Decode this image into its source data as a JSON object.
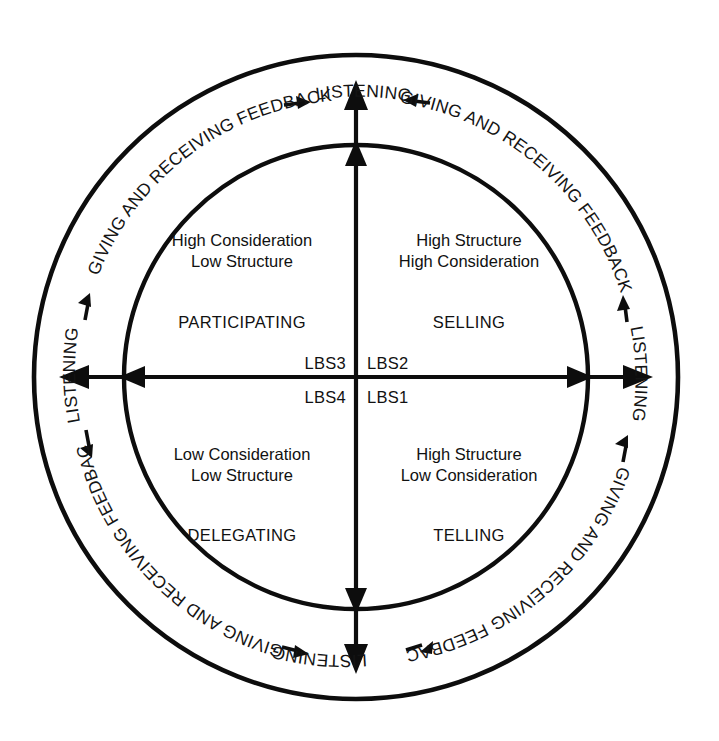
{
  "diagram": {
    "center": {
      "x": 356,
      "y": 377
    },
    "outer_circle_radius": 322,
    "inner_circle_radius": 232,
    "ring_text_radius": 277,
    "colors": {
      "stroke": "#0d0d0d",
      "text": "#111111",
      "background": "#ffffff"
    },
    "ring_labels": {
      "feedback": "GIVING AND RECEIVING FEEDBACK",
      "listening": "LISTENING"
    },
    "ring_sequence": [
      {
        "position": "top-left-arc",
        "text": "GIVING AND RECEIVING FEEDBACK"
      },
      {
        "position": "top",
        "text": "LISTENING"
      },
      {
        "position": "top-right-arc",
        "text": "GIVING AND RECEIVING FEEDBACK"
      },
      {
        "position": "right",
        "text": "LISTENING"
      },
      {
        "position": "bottom-right-arc",
        "text": "GIVING AND RECEIVING FEEDBACK"
      },
      {
        "position": "bottom",
        "text": "LISTENING"
      },
      {
        "position": "bottom-left-arc",
        "text": "GIVING AND RECEIVING FEEDBACK"
      },
      {
        "position": "left",
        "text": "LISTENING"
      }
    ],
    "quadrants": [
      {
        "id": "top-left",
        "code": "LBS3",
        "line1": "High Consideration",
        "line2": "Low Structure",
        "style": "PARTICIPATING"
      },
      {
        "id": "top-right",
        "code": "LBS2",
        "line1": "High Structure",
        "line2": "High Consideration",
        "style": "SELLING"
      },
      {
        "id": "bottom-left",
        "code": "LBS4",
        "line1": "Low Consideration",
        "line2": "Low Structure",
        "style": "DELEGATING"
      },
      {
        "id": "bottom-right",
        "code": "LBS1",
        "line1": "High Structure",
        "line2": "Low Consideration",
        "style": "TELLING"
      }
    ]
  }
}
